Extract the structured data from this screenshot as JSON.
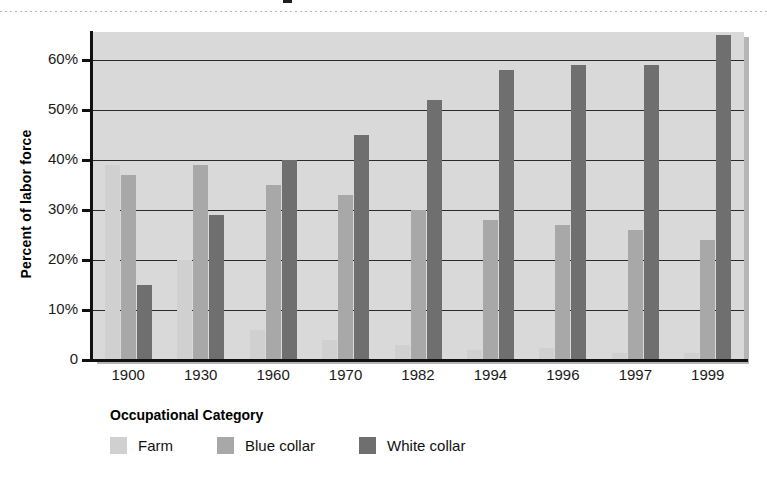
{
  "figure": {
    "width": 767,
    "height": 484,
    "background": "#ffffff",
    "plot_background": "#d9d9d9"
  },
  "chart_data": {
    "type": "bar",
    "title": "",
    "xlabel": "",
    "ylabel": "Percent of labor force",
    "categories": [
      "1900",
      "1930",
      "1960",
      "1970",
      "1982",
      "1994",
      "1996",
      "1997",
      "1999"
    ],
    "series": [
      {
        "name": "Farm",
        "color": "#d0d0d0",
        "values": [
          39,
          20,
          6,
          4,
          3,
          2,
          2.5,
          1.5,
          1.5
        ]
      },
      {
        "name": "Blue collar",
        "color": "#a8a8a8",
        "values": [
          37,
          39,
          35,
          33,
          30,
          28,
          27,
          26,
          24
        ]
      },
      {
        "name": "White collar",
        "color": "#6f6f6f",
        "values": [
          15,
          29,
          40,
          45,
          52,
          58,
          59,
          59,
          65
        ]
      }
    ],
    "ylim": [
      0,
      68
    ],
    "yticks": [
      0,
      10,
      20,
      30,
      40,
      50,
      60
    ],
    "ytick_labels": [
      "0",
      "10%",
      "20%",
      "30%",
      "40%",
      "50%",
      "60%"
    ],
    "grid": true,
    "grid_axis": "y",
    "legend_position": "below",
    "legend_title": "Occupational Category"
  },
  "legend": {
    "title": "Occupational Category",
    "items": [
      {
        "label": "Farm",
        "color": "#d0d0d0"
      },
      {
        "label": "Blue collar",
        "color": "#a8a8a8"
      },
      {
        "label": "White collar",
        "color": "#6f6f6f"
      }
    ]
  },
  "axes": {
    "y_title": "Percent of labor force",
    "y_tick_labels": [
      "60%",
      "50%",
      "40%",
      "30%",
      "20%",
      "10%",
      "0"
    ],
    "x_tick_labels": [
      "1900",
      "1930",
      "1960",
      "1970",
      "1982",
      "1994",
      "1996",
      "1997",
      "1999"
    ]
  }
}
